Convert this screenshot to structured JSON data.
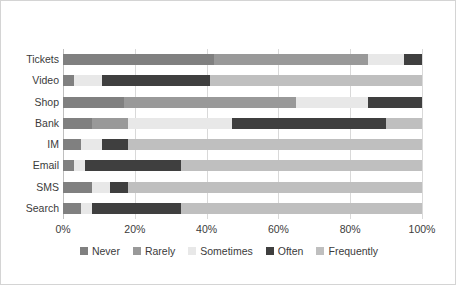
{
  "chart_data": {
    "type": "bar",
    "orientation": "horizontal",
    "stacked": true,
    "normalized": "100%",
    "title": "",
    "xlabel": "",
    "ylabel": "",
    "xlim": [
      0,
      100
    ],
    "xticks": [
      "0%",
      "20%",
      "40%",
      "60%",
      "80%",
      "100%"
    ],
    "xtick_values": [
      0,
      20,
      40,
      60,
      80,
      100
    ],
    "grid": true,
    "legend_position": "bottom",
    "categories": [
      "Tickets",
      "Video",
      "Shop",
      "Bank",
      "IM",
      "Email",
      "SMS",
      "Search"
    ],
    "series": [
      {
        "name": "Never",
        "color": "#808080",
        "values": [
          42,
          3,
          17,
          8,
          5,
          3,
          8,
          5
        ]
      },
      {
        "name": "Rarely",
        "color": "#999999",
        "values": [
          43,
          0,
          48,
          10,
          0,
          0,
          0,
          0
        ]
      },
      {
        "name": "Sometimes",
        "color": "#e8e8e8",
        "values": [
          10,
          8,
          20,
          29,
          6,
          3,
          5,
          3
        ]
      },
      {
        "name": "Often",
        "color": "#3f3f3f",
        "values": [
          5,
          30,
          15,
          43,
          7,
          27,
          5,
          25
        ]
      },
      {
        "name": "Frequently",
        "color": "#bfbfbf",
        "values": [
          0,
          59,
          0,
          10,
          82,
          67,
          82,
          67
        ]
      }
    ]
  },
  "legend": {
    "items": [
      {
        "label": "Never",
        "color": "#808080"
      },
      {
        "label": "Rarely",
        "color": "#999999"
      },
      {
        "label": "Sometimes",
        "color": "#e8e8e8"
      },
      {
        "label": "Often",
        "color": "#3f3f3f"
      },
      {
        "label": "Frequently",
        "color": "#bfbfbf"
      }
    ]
  },
  "style": {
    "border_color": "#d4d4d4",
    "gridline_color": "#d9d9d9",
    "axis_color": "#bfbfbf",
    "text_color": "#3b3b3b",
    "background": "#ffffff"
  }
}
